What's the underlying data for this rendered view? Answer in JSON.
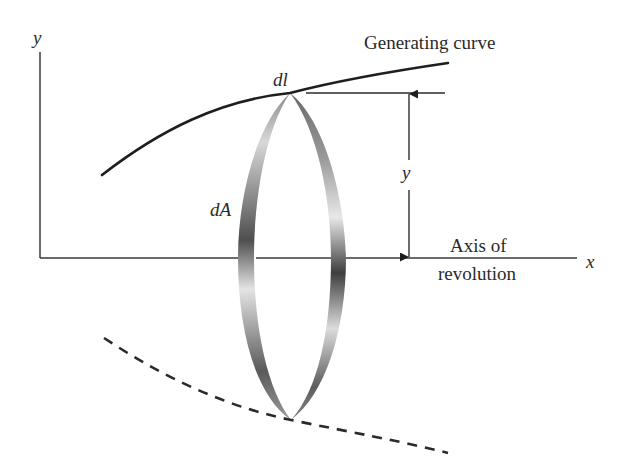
{
  "diagram": {
    "type": "surface-of-revolution",
    "labels": {
      "y_axis": "y",
      "x_axis": "x",
      "generating_curve": "Generating curve",
      "dl": "dl",
      "dA": "dA",
      "y_dimension": "y",
      "axis_line1": "Axis of",
      "axis_line2": "revolution"
    },
    "colors": {
      "ink": "#1e1e1e",
      "axis": "#3a3a3a",
      "band_dark": "#4a4a4a",
      "band_light": "#e6e6e6"
    }
  }
}
